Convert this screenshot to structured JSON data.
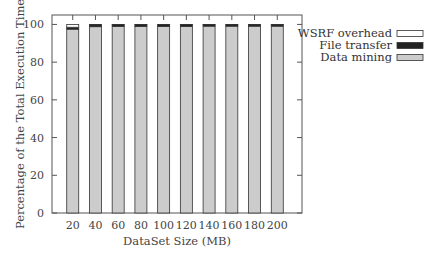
{
  "chart_data": {
    "type": "bar",
    "stacked": true,
    "title": "",
    "xlabel": "DataSet Size (MB)",
    "ylabel": "Percentage of the Total Execution Time",
    "ylim": [
      0,
      105
    ],
    "yticks": [
      0,
      20,
      40,
      60,
      80,
      100
    ],
    "categories": [
      "20",
      "40",
      "60",
      "80",
      "100",
      "120",
      "140",
      "160",
      "180",
      "200"
    ],
    "series": [
      {
        "name": "Data mining",
        "color": "#cccccc",
        "values": [
          97.5,
          98.8,
          99.0,
          99.0,
          99.0,
          99.0,
          99.1,
          99.1,
          99.1,
          99.1
        ]
      },
      {
        "name": "File transfer",
        "color": "#222222",
        "values": [
          1.0,
          1.0,
          0.9,
          0.9,
          0.9,
          0.9,
          0.8,
          0.8,
          0.8,
          0.8
        ]
      },
      {
        "name": "WSRF overhead",
        "color": "#ffffff",
        "values": [
          1.5,
          0.2,
          0.1,
          0.1,
          0.1,
          0.1,
          0.1,
          0.1,
          0.1,
          0.1
        ]
      }
    ],
    "legend": {
      "position": "right-top",
      "entries": [
        "WSRF overhead",
        "File transfer",
        "Data mining"
      ]
    },
    "grid": false
  }
}
